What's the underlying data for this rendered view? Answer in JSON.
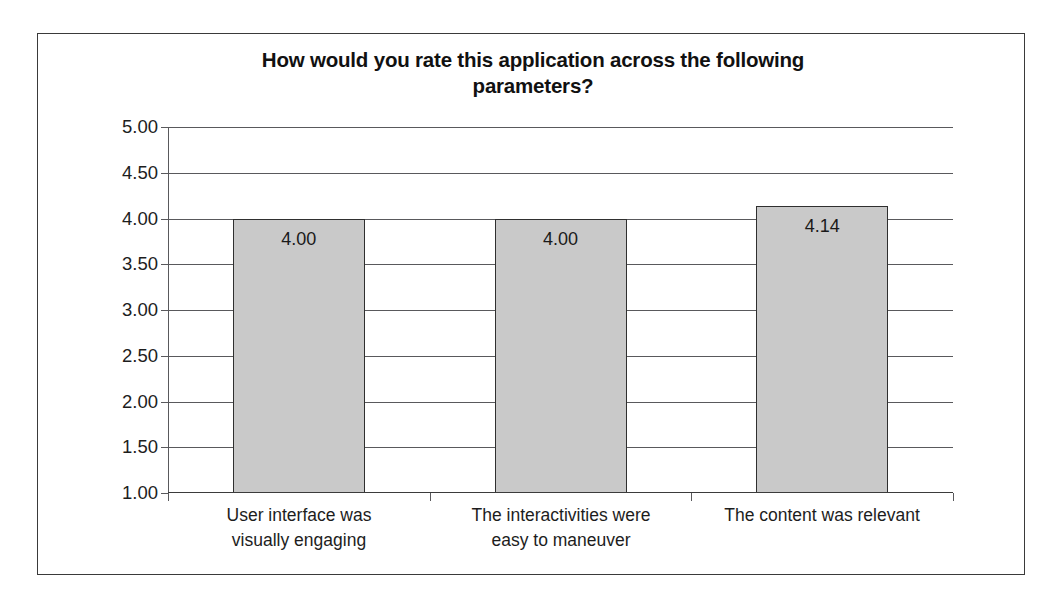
{
  "chart_data": {
    "type": "bar",
    "title": "How would you rate this application across the following parameters?",
    "title_line_1": "How would you rate this application across the following",
    "title_line_2": "parameters?",
    "categories": [
      "User interface was visually engaging",
      "The interactivities were easy to maneuver",
      "The content was relevant"
    ],
    "category_lines": [
      [
        "User interface was",
        "visually engaging"
      ],
      [
        "The interactivities were",
        "easy to maneuver"
      ],
      [
        "The content was relevant",
        ""
      ]
    ],
    "values": [
      4.0,
      4.0,
      4.14
    ],
    "value_labels": [
      "4.00",
      "4.00",
      "4.14"
    ],
    "xlabel": "",
    "ylabel": "",
    "ylim": [
      1.0,
      5.0
    ],
    "ytick_step": 0.5,
    "ytick_labels": [
      "5.00",
      "4.50",
      "4.00",
      "3.50",
      "3.00",
      "2.50",
      "2.00",
      "1.50",
      "1.00"
    ],
    "ytick_values": [
      5.0,
      4.5,
      4.0,
      3.5,
      3.0,
      2.5,
      2.0,
      1.5,
      1.0
    ],
    "grid": true,
    "legend": false,
    "bar_fill_color": "#c9c9c9",
    "bar_border_color": "#2f2f2f",
    "gridline_color": "#59595c",
    "frame_color": "#3a3a3a"
  }
}
